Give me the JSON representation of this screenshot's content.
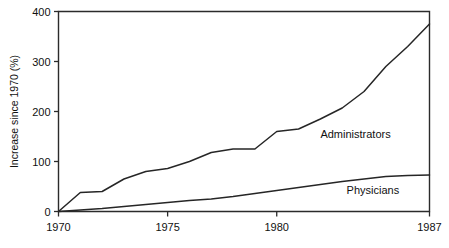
{
  "chart_data": {
    "type": "line",
    "title": "",
    "xlabel": "",
    "ylabel": "Increase since 1970 (%)",
    "xlim": [
      1970,
      1987
    ],
    "ylim": [
      0,
      400
    ],
    "grid": false,
    "legend_position": "inline-right",
    "x": [
      1970,
      1971,
      1972,
      1973,
      1974,
      1975,
      1976,
      1977,
      1978,
      1979,
      1980,
      1981,
      1982,
      1983,
      1984,
      1985,
      1986,
      1987
    ],
    "xticks": [
      1970,
      1975,
      1980,
      1987
    ],
    "xticklabels": [
      "1970",
      "1975",
      "1980",
      "1987"
    ],
    "yticks": [
      0,
      100,
      200,
      300,
      400
    ],
    "yticklabels": [
      "0",
      "100",
      "200",
      "300",
      "400"
    ],
    "series": [
      {
        "name": "Administrators",
        "label": "Administrators",
        "color": "#262626",
        "values": [
          0,
          38,
          40,
          65,
          80,
          86,
          100,
          118,
          125,
          125,
          160,
          165,
          185,
          207,
          240,
          290,
          330,
          375
        ]
      },
      {
        "name": "Physicians",
        "label": "Physicians",
        "color": "#262626",
        "values": [
          0,
          3,
          6,
          10,
          14,
          18,
          22,
          25,
          30,
          36,
          42,
          48,
          54,
          60,
          65,
          70,
          72,
          73
        ]
      }
    ],
    "annotations": [
      {
        "text": "Administrators",
        "x": 1982.0,
        "y": 148
      },
      {
        "text": "Physicians",
        "x": 1983.2,
        "y": 36
      }
    ]
  },
  "axis": {
    "y_title": "Increase since 1970 (%)"
  }
}
